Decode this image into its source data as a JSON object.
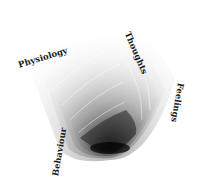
{
  "diagram": {
    "type": "spiral-vortex",
    "labels": [
      {
        "id": "physiology",
        "text": "Physiology"
      },
      {
        "id": "thoughts",
        "text": "Thoughts"
      },
      {
        "id": "feelings",
        "text": "Feelings"
      },
      {
        "id": "behaviour",
        "text": "Behaviour"
      }
    ],
    "colors": {
      "light": "#ffffff",
      "dark": "#111111"
    }
  }
}
